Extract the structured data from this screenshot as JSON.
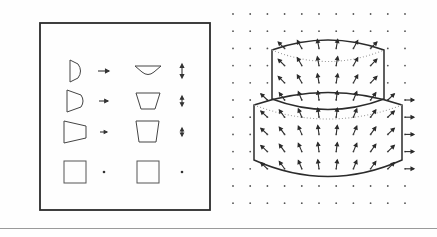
{
  "figure": {
    "background_color": "#fefefe",
    "stroke_color": "#2b2b2b",
    "dot_color": "#555555",
    "dotted_color": "#8a8a8a",
    "rule_color": "#9a9a9a",
    "width": 437,
    "height": 237,
    "panels": [
      {
        "id": "left",
        "name": "shape-deformation-panel",
        "x": 0,
        "width": 219
      },
      {
        "id": "right",
        "name": "cylinder-vector-field-panel",
        "x": 219,
        "width": 218
      }
    ]
  },
  "left_panel": {
    "frame": {
      "x": 40,
      "y": 23,
      "width": 170,
      "height": 187,
      "stroke_width": 1.8
    },
    "columns": [
      {
        "name": "source-shape-column",
        "cx": 75
      },
      {
        "name": "source-arrow-column",
        "cx": 104
      },
      {
        "name": "target-shape-column",
        "cx": 148
      },
      {
        "name": "target-arrow-column",
        "cx": 182
      }
    ],
    "rows": [
      {
        "row": 1,
        "cy": 71,
        "source_shape": "narrow-wedge-curved",
        "source_width": 11,
        "source_height": 22,
        "source_curve": 5,
        "source_taper": 0.82,
        "arrow_left_len": 11,
        "arrow_left_dir": "right",
        "target_shape": "flat-trapezoid-curved",
        "target_width": 26,
        "target_height": 9,
        "target_curve": 5,
        "target_taper": 0.42,
        "arrow_right_len": 12,
        "arrow_right_dir": "vertical-both"
      },
      {
        "row": 2,
        "cy": 101,
        "source_shape": "wedge-curved",
        "source_width": 16,
        "source_height": 22,
        "source_curve": 4,
        "source_taper": 0.62,
        "arrow_left_len": 9,
        "arrow_left_dir": "right",
        "target_shape": "trapezoid",
        "target_width": 24,
        "target_height": 16,
        "target_curve": 2,
        "target_taper": 0.62,
        "arrow_right_len": 8,
        "arrow_right_dir": "vertical-both"
      },
      {
        "row": 3,
        "cy": 132,
        "source_shape": "wide-trapezoid",
        "source_width": 22,
        "source_height": 22,
        "source_curve": 1,
        "source_taper": 0.55,
        "arrow_left_len": 7,
        "arrow_left_dir": "right",
        "target_shape": "trapezoid-tall",
        "target_width": 23,
        "target_height": 21,
        "target_curve": 0,
        "target_taper": 0.78,
        "arrow_right_len": 6,
        "arrow_right_dir": "vertical-both"
      },
      {
        "row": 4,
        "cy": 172,
        "source_shape": "square",
        "source_width": 22,
        "source_height": 22,
        "source_curve": 0,
        "source_taper": 1.0,
        "arrow_left_len": 0,
        "arrow_left_dir": "dot",
        "target_shape": "square",
        "target_width": 22,
        "target_height": 22,
        "target_curve": 0,
        "target_taper": 1.0,
        "arrow_right_len": 0,
        "arrow_right_dir": "dot"
      }
    ]
  },
  "right_panel": {
    "dot_grid": {
      "name": "background-dot-grid",
      "x_start": 14,
      "y_start": 14,
      "spacing_x": 17.2,
      "spacing_y": 17.2,
      "cols": 11,
      "rows": 12,
      "dot_radius": 0.9
    },
    "upper_cylinder": {
      "name": "upper-cylinder",
      "cx": 109,
      "left": 53,
      "right": 165,
      "top_y": 41,
      "bottom_y": 99,
      "ellipse_ry": 9,
      "top_arc": "solid",
      "back_arc": "dotted"
    },
    "lower_cylinder": {
      "name": "lower-cylinder",
      "cx": 109,
      "left": 35,
      "right": 183,
      "top_y": 94,
      "bottom_y": 172,
      "ellipse_ry": 11,
      "top_arc": "solid",
      "back_arc": "dotted",
      "bottom_arc": "solid"
    },
    "vector_field": {
      "name": "displacement-vector-field",
      "description": "arrows pointing outward/upward from cylinder axis",
      "arrow_len": 9,
      "head_len": 3
    }
  }
}
